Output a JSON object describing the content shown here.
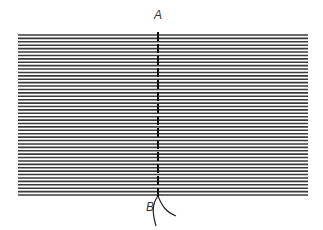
{
  "diagram": {
    "labels": {
      "top": "A",
      "bottom": "B"
    },
    "line_count": 48,
    "line_color": "#3a3a3a",
    "marker_color": "#111111",
    "geometry": {
      "x_start": 18,
      "x_end": 308,
      "y_start": 35,
      "y_end": 195,
      "marker_x": 158
    }
  }
}
